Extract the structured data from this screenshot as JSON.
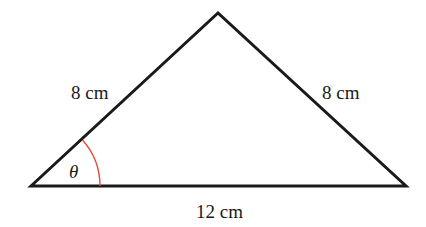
{
  "diagram": {
    "type": "isosceles-triangle",
    "sides": {
      "left": "8 cm",
      "right": "8 cm",
      "base": "12 cm"
    },
    "angle_label": "θ",
    "colors": {
      "stroke": "#1a1a1a",
      "angle_arc": "#e0503c",
      "background": "#ffffff"
    }
  }
}
